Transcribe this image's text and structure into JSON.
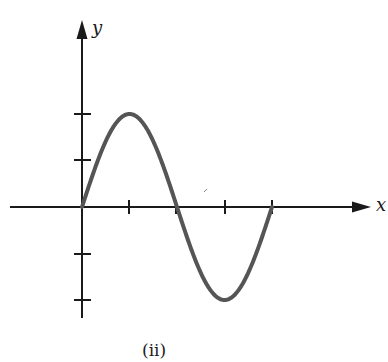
{
  "figure": {
    "caption": "(ii)",
    "x_axis_label": "x",
    "y_axis_label": "y"
  },
  "colors": {
    "axis": "#1a1a1a",
    "curve": "#555555",
    "background": "#ffffff"
  },
  "chart_data": {
    "type": "line",
    "title": "",
    "caption": "(ii)",
    "xlabel": "x",
    "ylabel": "y",
    "x_ticks": [
      1,
      2,
      3,
      4
    ],
    "y_ticks": [
      -2,
      -1,
      1,
      2
    ],
    "tick_labels_shown": false,
    "xlim": [
      -1.5,
      4.1
    ],
    "ylim": [
      -2.4,
      4.0
    ],
    "grid": false,
    "legend": null,
    "series": [
      {
        "name": "y = 2 sin(pi x / 2)",
        "x": [
          0,
          0.5,
          1,
          1.5,
          2,
          2.5,
          3,
          3.5,
          4
        ],
        "y": [
          0,
          1.41,
          2,
          1.41,
          0,
          -1.41,
          -2,
          -1.41,
          0
        ]
      }
    ]
  }
}
